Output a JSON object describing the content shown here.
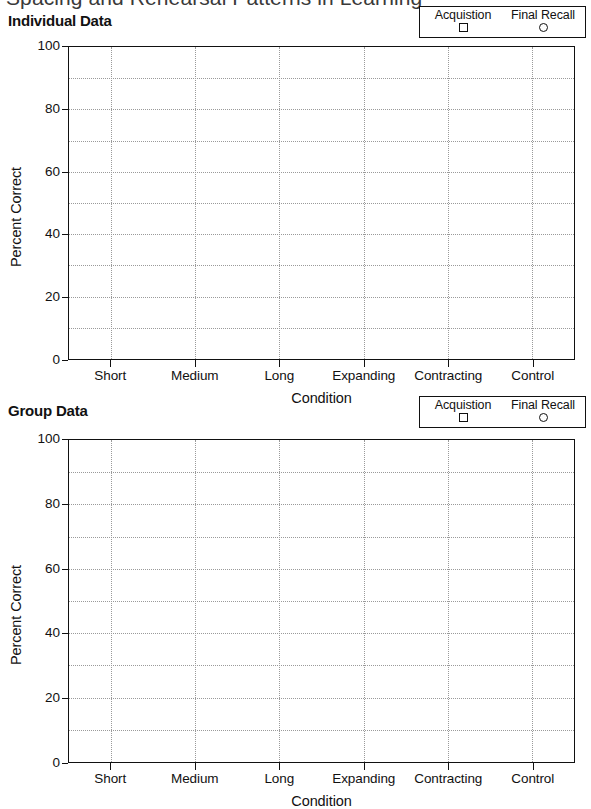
{
  "document": {
    "title": "Spacing and Rehearsal Patterns in Learning"
  },
  "panels": [
    {
      "id": "individual",
      "title": "Individual Data",
      "legend": {
        "entries": [
          {
            "label": "Acquistion",
            "marker": "square"
          },
          {
            "label": "Final Recall",
            "marker": "circle"
          }
        ]
      }
    },
    {
      "id": "group",
      "title": "Group Data",
      "legend": {
        "entries": [
          {
            "label": "Acquistion",
            "marker": "square"
          },
          {
            "label": "Final Recall",
            "marker": "circle"
          }
        ]
      }
    }
  ],
  "chart_data": [
    {
      "type": "line",
      "title": "Individual Data",
      "xlabel": "Condition",
      "ylabel": "Percent Correct",
      "categories": [
        "Short",
        "Medium",
        "Long",
        "Expanding",
        "Contracting",
        "Control"
      ],
      "ytick_labels": [
        "0",
        "20",
        "40",
        "60",
        "80",
        "100"
      ],
      "yticks": [
        0,
        20,
        40,
        60,
        80,
        100
      ],
      "ylim": [
        0,
        100
      ],
      "grid": true,
      "grid_y_step": 10,
      "grid_x_at_categories": true,
      "legend_position": "top-right",
      "series": [
        {
          "name": "Acquistion",
          "marker": "square",
          "values": []
        },
        {
          "name": "Final Recall",
          "marker": "circle",
          "values": []
        }
      ]
    },
    {
      "type": "line",
      "title": "Group Data",
      "xlabel": "Condition",
      "ylabel": "Percent Correct",
      "categories": [
        "Short",
        "Medium",
        "Long",
        "Expanding",
        "Contracting",
        "Control"
      ],
      "ytick_labels": [
        "0",
        "20",
        "40",
        "60",
        "80",
        "100"
      ],
      "yticks": [
        0,
        20,
        40,
        60,
        80,
        100
      ],
      "ylim": [
        0,
        100
      ],
      "grid": true,
      "grid_y_step": 10,
      "grid_x_at_categories": true,
      "legend_position": "top-right",
      "series": [
        {
          "name": "Acquistion",
          "marker": "square",
          "values": []
        },
        {
          "name": "Final Recall",
          "marker": "circle",
          "values": []
        }
      ]
    }
  ]
}
